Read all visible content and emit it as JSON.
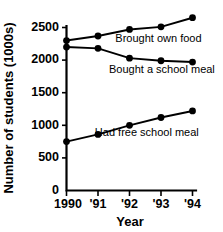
{
  "chart_data": {
    "type": "line",
    "title": "",
    "xlabel": "Year",
    "ylabel": "Number of students (1000s)",
    "x": [
      1990,
      1991,
      1992,
      1993,
      1994
    ],
    "categories": [
      "1990",
      "'91",
      "'92",
      "'93",
      "'94"
    ],
    "ylim": [
      0,
      2500
    ],
    "yticks": [
      0,
      500,
      1000,
      1500,
      2000,
      2500
    ],
    "ytick_labels": [
      "0",
      "500",
      "1000",
      "1500",
      "2000",
      "2500"
    ],
    "grid": false,
    "legend_position": "inline-annotations",
    "series": [
      {
        "name": "Brought own food",
        "values": [
          2300,
          2370,
          2470,
          2510,
          2650
        ],
        "label_x": 1991.55,
        "label_y": 2280
      },
      {
        "name": "Bought a school meal",
        "values": [
          2200,
          2180,
          2030,
          1990,
          1970
        ],
        "label_x": 1991.35,
        "label_y": 1800
      },
      {
        "name": "Had free school meal",
        "values": [
          750,
          860,
          1000,
          1120,
          1220
        ],
        "label_x": 1990.9,
        "label_y": 830
      }
    ]
  },
  "axis_titles": {
    "x": "Year",
    "y": "Number of students (1000s)"
  },
  "colors": {
    "ink": "#000000",
    "background": "#ffffff"
  }
}
